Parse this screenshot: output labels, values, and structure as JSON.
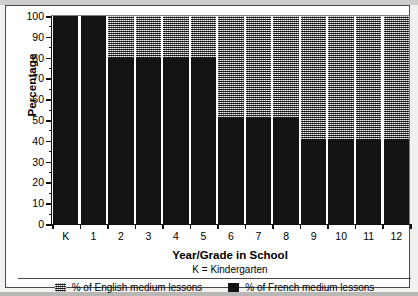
{
  "chart_data": {
    "type": "bar",
    "stacked": true,
    "title": "",
    "xlabel": "Year/Grade in School",
    "ylabel": "Percentage",
    "ylim": [
      0,
      100
    ],
    "yticks": [
      0,
      10,
      20,
      30,
      40,
      50,
      60,
      70,
      80,
      90,
      100
    ],
    "grid": false,
    "legend_position": "bottom",
    "categories": [
      "K",
      "1",
      "2",
      "3",
      "4",
      "5",
      "6",
      "7",
      "8",
      "9",
      "10",
      "11",
      "12"
    ],
    "series": [
      {
        "name": "% of French medium lessons",
        "color": "#131313",
        "values": [
          100,
          100,
          80,
          80,
          80,
          80,
          51,
          51,
          51,
          41,
          41,
          41,
          41
        ]
      },
      {
        "name": "% of English medium lessons",
        "color": "#9a9a9a",
        "values": [
          0,
          0,
          20,
          20,
          20,
          20,
          49,
          49,
          49,
          59,
          59,
          59,
          59
        ]
      }
    ],
    "annotations": [
      "K = Kindergarten"
    ]
  },
  "figure": {
    "y_axis_title": "Percentage",
    "x_axis_title": "Year/Grade in School",
    "footnote": "K = Kindergarten"
  },
  "legend": {
    "items": [
      {
        "label": "% of English medium lessons",
        "swatch": "checkered-swatch-icon"
      },
      {
        "label": "% of French medium lessons",
        "swatch": "solid-black-swatch-icon"
      }
    ]
  }
}
